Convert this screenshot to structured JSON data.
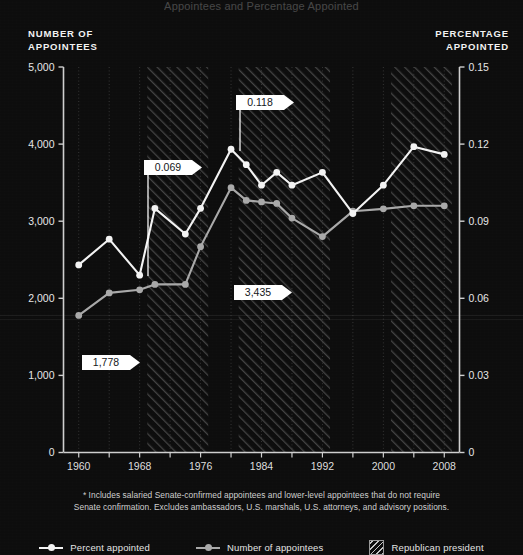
{
  "title_partial": "Appointees and Percentage Appointed",
  "axes": {
    "left_caption_line1": "NUMBER OF",
    "left_caption_line2": "APPOINTEES",
    "right_caption_line1": "PERCENTAGE",
    "right_caption_line2": "APPOINTED",
    "left_ticks": [
      "5,000",
      "4,000",
      "3,000",
      "2,000",
      "1,000",
      "0"
    ],
    "right_ticks": [
      "0.15",
      "0.12",
      "0.09",
      "0.06",
      "0.03",
      "0"
    ],
    "x_ticks": [
      "1960",
      "1968",
      "1976",
      "1984",
      "1992",
      "2000",
      "2008"
    ]
  },
  "callouts": [
    {
      "id": "peak-percent",
      "label": "0.118"
    },
    {
      "id": "nixon-percent",
      "label": "0.069"
    },
    {
      "id": "peak-number",
      "label": "3,435"
    },
    {
      "id": "start-number",
      "label": "1,778"
    }
  ],
  "footnote": {
    "line1": "* Includes salaried Senate-confirmed appointees and lower-level appointees that do not require",
    "line2": "Senate confirmation. Excludes ambassadors, U.S. marshals, U.S. attorneys, and advisory positions."
  },
  "legend": [
    {
      "id": "percent-appointed",
      "label": "Percent appointed",
      "type": "line",
      "color": "#f3f3f3"
    },
    {
      "id": "number-of-appointees",
      "label": "Number of appointees",
      "type": "line",
      "color": "#a9a9a9"
    },
    {
      "id": "republican-president",
      "label": "Republican president",
      "type": "hatch",
      "color": "#9a9a9a"
    }
  ],
  "colors": {
    "background": "#0d0d0d",
    "percent_line": "#f3f3f3",
    "number_line": "#a9a9a9",
    "axis": "#cfcfcf",
    "gridline": "#3a3a3a",
    "callout_bg": "#ffffff",
    "callout_text": "#14161a",
    "hatch": "#6e6e6e"
  },
  "chart_data": {
    "type": "line",
    "title": "Appointees and Percentage Appointed",
    "xlabel": "",
    "ylabel": "NUMBER OF APPOINTEES",
    "y2label": "PERCENTAGE APPOINTED",
    "xlim": [
      1958,
      2010
    ],
    "ylim": [
      0,
      5000
    ],
    "y2lim": [
      0,
      0.15
    ],
    "grid": true,
    "legend_position": "bottom",
    "x": [
      1960,
      1962,
      1964,
      1966,
      1968,
      1970,
      1972,
      1974,
      1976,
      1978,
      1980,
      1982,
      1984,
      1986,
      1988,
      1990,
      1992,
      1994,
      1996,
      1998,
      2000,
      2002,
      2004,
      2006,
      2008
    ],
    "series": [
      {
        "name": "Percent appointed",
        "axis": "right",
        "color": "#f3f3f3",
        "values": [
          0.073,
          null,
          0.083,
          null,
          0.069,
          0.095,
          null,
          0.085,
          0.118,
          null,
          0.112,
          null,
          0.104,
          0.099,
          null,
          0.109,
          null,
          0.093,
          null,
          0.104,
          null,
          0.119,
          0.116,
          null,
          null
        ]
      },
      {
        "name": "Number of appointees",
        "axis": "left",
        "color": "#a9a9a9",
        "values": [
          1778,
          null,
          2070,
          null,
          2110,
          2680,
          null,
          2410,
          3435,
          null,
          3270,
          null,
          3230,
          3440,
          null,
          3330,
          null,
          2850,
          null,
          3130,
          null,
          3200,
          3200,
          null,
          null
        ]
      }
    ],
    "points_percent": [
      {
        "year": 1960,
        "value": 0.073
      },
      {
        "year": 1964,
        "value": 0.083
      },
      {
        "year": 1968,
        "value": 0.069
      },
      {
        "year": 1970,
        "value": 0.095
      },
      {
        "year": 1974,
        "value": 0.085
      },
      {
        "year": 1976,
        "value": 0.095
      },
      {
        "year": 1980,
        "value": 0.118
      },
      {
        "year": 1982,
        "value": 0.112
      },
      {
        "year": 1984,
        "value": 0.104
      },
      {
        "year": 1986,
        "value": 0.109
      },
      {
        "year": 1988,
        "value": 0.104
      },
      {
        "year": 1992,
        "value": 0.109
      },
      {
        "year": 1996,
        "value": 0.093
      },
      {
        "year": 2000,
        "value": 0.104
      },
      {
        "year": 2004,
        "value": 0.119
      },
      {
        "year": 2008,
        "value": 0.116
      }
    ],
    "points_number": [
      {
        "year": 1960,
        "value": 1778
      },
      {
        "year": 1964,
        "value": 2070
      },
      {
        "year": 1968,
        "value": 2110
      },
      {
        "year": 1970,
        "value": 2180
      },
      {
        "year": 1974,
        "value": 2180
      },
      {
        "year": 1976,
        "value": 2670
      },
      {
        "year": 1980,
        "value": 3435
      },
      {
        "year": 1982,
        "value": 3270
      },
      {
        "year": 1984,
        "value": 3250
      },
      {
        "year": 1986,
        "value": 3230
      },
      {
        "year": 1988,
        "value": 3040
      },
      {
        "year": 1992,
        "value": 2800
      },
      {
        "year": 1996,
        "value": 3130
      },
      {
        "year": 2000,
        "value": 3160
      },
      {
        "year": 2004,
        "value": 3200
      },
      {
        "year": 2008,
        "value": 3200
      }
    ],
    "republican_periods": [
      {
        "start": 1969,
        "end": 1977
      },
      {
        "start": 1981,
        "end": 1993
      },
      {
        "start": 2001,
        "end": 2009
      }
    ],
    "annotations": [
      {
        "label": "0.118",
        "series": "Percent appointed",
        "year": 1980,
        "value": 0.118
      },
      {
        "label": "0.069",
        "series": "Percent appointed",
        "year": 1968,
        "value": 0.069
      },
      {
        "label": "3,435",
        "series": "Number of appointees",
        "year": 1980,
        "value": 3435
      },
      {
        "label": "1,778",
        "series": "Number of appointees",
        "year": 1960,
        "value": 1778
      }
    ]
  }
}
